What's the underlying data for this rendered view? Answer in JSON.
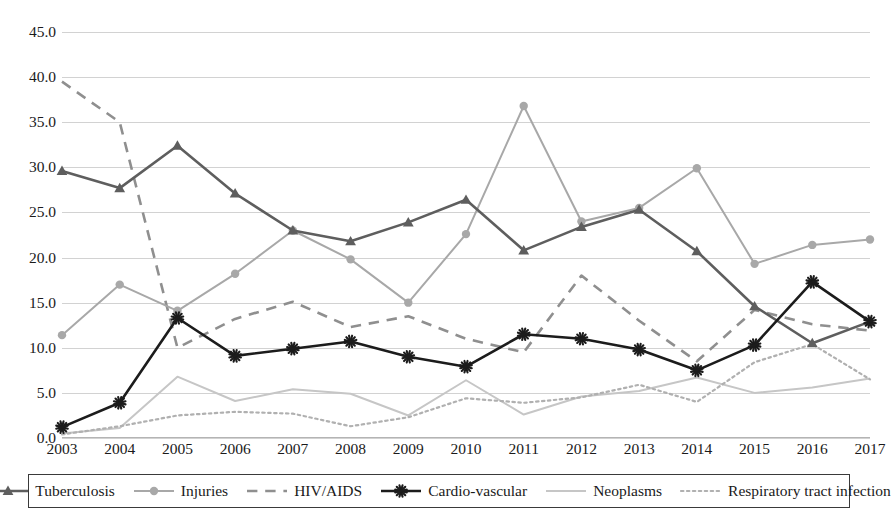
{
  "chart_data": {
    "type": "line",
    "title": "",
    "subtitle": "",
    "xlabel": "",
    "ylabel": "",
    "grid": true,
    "legend_position": "bottom",
    "xlim": [
      2003,
      2017
    ],
    "ylim": [
      0.0,
      45.0
    ],
    "ytick_step": 5.0,
    "categories": [
      "2003",
      "2004",
      "2005",
      "2006",
      "2007",
      "2008",
      "2009",
      "2010",
      "2011",
      "2012",
      "2013",
      "2014",
      "2015",
      "2016",
      "2017"
    ],
    "x": [
      2003,
      2004,
      2005,
      2006,
      2007,
      2008,
      2009,
      2010,
      2011,
      2012,
      2013,
      2014,
      2015,
      2016,
      2017
    ],
    "yticks": [
      "0.0",
      "5.0",
      "10.0",
      "15.0",
      "20.0",
      "25.0",
      "30.0",
      "35.0",
      "40.0",
      "45.0"
    ],
    "series": [
      {
        "name": "Tuberculosis",
        "color": "#5e5e5e",
        "style": "solid",
        "marker": "triangle",
        "values": [
          29.6,
          27.7,
          32.4,
          27.1,
          23.0,
          21.8,
          23.9,
          26.4,
          20.8,
          23.4,
          25.3,
          20.7,
          14.6,
          10.5,
          12.9
        ]
      },
      {
        "name": "Injuries",
        "color": "#a8a8a8",
        "style": "solid",
        "marker": "circle",
        "values": [
          11.4,
          17.0,
          14.1,
          18.2,
          23.0,
          19.8,
          15.0,
          22.6,
          36.8,
          24.0,
          25.5,
          29.9,
          19.3,
          21.4,
          22.0
        ]
      },
      {
        "name": "HIV/AIDS",
        "color": "#8f8f8f",
        "style": "dashed",
        "marker": "none",
        "values": [
          39.5,
          35.0,
          10.0,
          13.2,
          15.1,
          12.3,
          13.5,
          11.0,
          9.5,
          18.0,
          13.0,
          8.5,
          14.2,
          12.6,
          11.9
        ]
      },
      {
        "name": "Cardio-vascular",
        "color": "#1c1c1c",
        "style": "solid",
        "marker": "star",
        "values": [
          1.2,
          3.9,
          13.3,
          9.1,
          9.9,
          10.7,
          9.0,
          7.9,
          11.5,
          11.0,
          9.8,
          7.5,
          10.3,
          17.3,
          12.9
        ]
      },
      {
        "name": "Neoplasms",
        "color": "#c6c6c6",
        "style": "solid",
        "marker": "none",
        "values": [
          0.5,
          1.1,
          6.8,
          4.1,
          5.4,
          4.9,
          2.5,
          6.4,
          2.6,
          4.6,
          5.2,
          6.7,
          5.0,
          5.6,
          6.6
        ]
      },
      {
        "name": "Respiratory tract infection",
        "color": "#b0b0b0",
        "style": "dotted",
        "marker": "none",
        "values": [
          0.4,
          1.3,
          2.5,
          2.9,
          2.7,
          1.3,
          2.3,
          4.4,
          3.9,
          4.5,
          5.9,
          4.0,
          8.4,
          10.4,
          6.5
        ]
      }
    ]
  },
  "legend": {
    "items": [
      {
        "label": "Tuberculosis"
      },
      {
        "label": "Injuries"
      },
      {
        "label": "HIV/AIDS"
      },
      {
        "label": "Cardio-vascular"
      },
      {
        "label": "Neoplasms"
      },
      {
        "label": "Respiratory tract infection"
      }
    ]
  },
  "colors": {
    "background": "#ffffff",
    "grid": "#d2d2d2",
    "text": "#1a1a1a",
    "legend_border": "#3a3a3a"
  }
}
